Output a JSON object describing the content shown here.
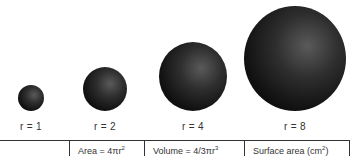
{
  "spheres": [
    {
      "label": "r = 1",
      "radius": 1
    },
    {
      "label": "r = 2",
      "radius": 2
    },
    {
      "label": "r = 4",
      "radius": 4
    },
    {
      "label": "r = 8",
      "radius": 8
    }
  ],
  "table": {
    "headers": [
      {
        "text": ""
      },
      {
        "text": "Area = 4πr",
        "sup": "2"
      },
      {
        "text": "Volume = 4/3πr",
        "sup": "3"
      },
      {
        "text": "Surface area (cm",
        "sup": "2",
        "suffix": ")"
      }
    ]
  }
}
